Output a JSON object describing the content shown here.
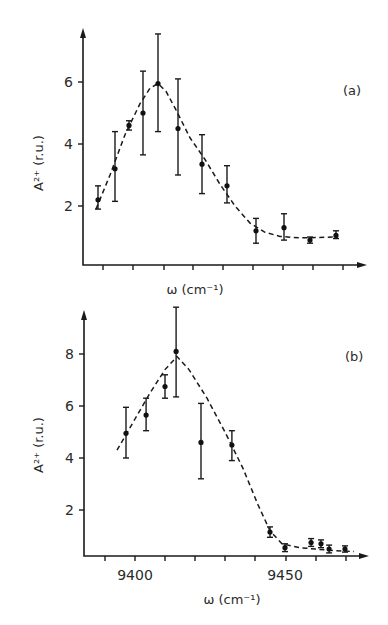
{
  "chart_data": [
    {
      "type": "scatter",
      "panel_label": "(a)",
      "xlabel": "ω (cm⁻¹)",
      "ylabel": "A²⁺ (r.u.)",
      "xticks_labeled": [],
      "x_tick_count": 9,
      "yticks": [
        2,
        4,
        6
      ],
      "grid": false,
      "legend": null,
      "series": [
        {
          "name": "data (with error bars)",
          "points": [
            {
              "x_px": 98,
              "y": 2.2,
              "err_hi": 2.65,
              "err_lo": 1.9
            },
            {
              "x_px": 115,
              "y": 3.2,
              "err_hi": 4.4,
              "err_lo": 2.15
            },
            {
              "x_px": 129,
              "y": 4.6,
              "err_hi": 4.75,
              "err_lo": 4.45
            },
            {
              "x_px": 143,
              "y": 5.0,
              "err_hi": 6.35,
              "err_lo": 3.65
            },
            {
              "x_px": 158,
              "y": 5.95,
              "err_hi": 7.55,
              "err_lo": 4.4
            },
            {
              "x_px": 178,
              "y": 4.5,
              "err_hi": 6.1,
              "err_lo": 3.0
            },
            {
              "x_px": 202,
              "y": 3.35,
              "err_hi": 4.3,
              "err_lo": 2.4
            },
            {
              "x_px": 227,
              "y": 2.65,
              "err_hi": 3.3,
              "err_lo": 2.1
            },
            {
              "x_px": 256,
              "y": 1.2,
              "err_hi": 1.6,
              "err_lo": 0.8
            },
            {
              "x_px": 284,
              "y": 1.3,
              "err_hi": 1.75,
              "err_lo": 0.9
            },
            {
              "x_px": 310,
              "y": 0.9,
              "err_hi": 1.0,
              "err_lo": 0.8
            },
            {
              "x_px": 336,
              "y": 1.05,
              "err_hi": 1.2,
              "err_lo": 0.95
            }
          ]
        },
        {
          "name": "fit (dashed)",
          "curve": [
            [
              96,
              1.9
            ],
            [
              110,
              3.0
            ],
            [
              125,
              4.3
            ],
            [
              140,
              5.3
            ],
            [
              150,
              5.8
            ],
            [
              158,
              5.95
            ],
            [
              166,
              5.7
            ],
            [
              176,
              5.1
            ],
            [
              190,
              4.2
            ],
            [
              205,
              3.5
            ],
            [
              220,
              2.7
            ],
            [
              235,
              2.0
            ],
            [
              250,
              1.45
            ],
            [
              265,
              1.15
            ],
            [
              280,
              1.02
            ],
            [
              300,
              0.97
            ],
            [
              338,
              1.0
            ]
          ]
        }
      ]
    },
    {
      "type": "scatter",
      "panel_label": "(b)",
      "xlabel": "ω (cm⁻¹)",
      "ylabel": "A²⁺ (r.u.)",
      "xticks_labeled": [
        9400,
        9450
      ],
      "xlim": [
        9390,
        9475
      ],
      "yticks": [
        2,
        4,
        6,
        8
      ],
      "grid": false,
      "legend": null,
      "series": [
        {
          "name": "data (with error bars)",
          "points": [
            {
              "x": 9397,
              "y": 4.95,
              "err_hi": 5.95,
              "err_lo": 4.0
            },
            {
              "x": 9403.7,
              "y": 5.65,
              "err_hi": 6.3,
              "err_lo": 5.05
            },
            {
              "x": 9410,
              "y": 6.75,
              "err_hi": 7.2,
              "err_lo": 6.3
            },
            {
              "x": 9413.7,
              "y": 8.1,
              "err_hi": 9.8,
              "err_lo": 6.35
            },
            {
              "x": 9422,
              "y": 4.6,
              "err_hi": 6.1,
              "err_lo": 3.2
            },
            {
              "x": 9432.3,
              "y": 4.5,
              "err_hi": 5.05,
              "err_lo": 3.9
            },
            {
              "x": 9445,
              "y": 1.15,
              "err_hi": 1.35,
              "err_lo": 0.95
            },
            {
              "x": 9450,
              "y": 0.55,
              "err_hi": 0.7,
              "err_lo": 0.4
            },
            {
              "x": 9458.7,
              "y": 0.75,
              "err_hi": 0.9,
              "err_lo": 0.6
            },
            {
              "x": 9462,
              "y": 0.7,
              "err_hi": 0.85,
              "err_lo": 0.55
            },
            {
              "x": 9464.7,
              "y": 0.5,
              "err_hi": 0.65,
              "err_lo": 0.35
            },
            {
              "x": 9470,
              "y": 0.5,
              "err_hi": 0.62,
              "err_lo": 0.38
            }
          ]
        },
        {
          "name": "fit (dashed)",
          "curve": [
            [
              9394,
              4.3
            ],
            [
              9400,
              5.5
            ],
            [
              9405,
              6.5
            ],
            [
              9410,
              7.4
            ],
            [
              9414,
              7.9
            ],
            [
              9418,
              7.4
            ],
            [
              9424,
              6.3
            ],
            [
              9430,
              5.0
            ],
            [
              9436,
              3.6
            ],
            [
              9441,
              2.2
            ],
            [
              9445,
              1.2
            ],
            [
              9449,
              0.7
            ],
            [
              9455,
              0.55
            ],
            [
              9465,
              0.45
            ],
            [
              9473,
              0.4
            ]
          ]
        }
      ]
    }
  ],
  "panels": {
    "a": {
      "label": "(a)",
      "xlabel": "ω (cm⁻¹)",
      "ylabel": "A²⁺ (r.u.)"
    },
    "b": {
      "label": "(b)",
      "xlabel": "ω (cm⁻¹)",
      "ylabel": "A²⁺ (r.u.)"
    }
  }
}
